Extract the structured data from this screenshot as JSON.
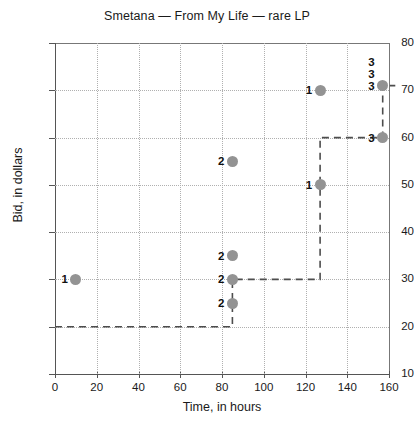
{
  "chart_data": {
    "type": "scatter",
    "title": "Smetana — From My Life — rare LP",
    "xlabel": "Time, in hours",
    "ylabel": "Bid, in dollars",
    "xlim": [
      0,
      160
    ],
    "ylim": [
      10,
      80
    ],
    "xticks": [
      0,
      20,
      40,
      60,
      80,
      100,
      120,
      140,
      160
    ],
    "yticks": [
      10,
      20,
      30,
      40,
      50,
      60,
      70,
      80
    ],
    "grid": true,
    "legend": "none",
    "marker_color": "#939393",
    "step_line_color": "#4d4d4d",
    "points": [
      {
        "x": 10,
        "y": 30,
        "label": "1"
      },
      {
        "x": 85,
        "y": 55,
        "label": "2"
      },
      {
        "x": 85,
        "y": 35,
        "label": "2"
      },
      {
        "x": 85,
        "y": 30,
        "label": "2"
      },
      {
        "x": 85,
        "y": 25,
        "label": "2"
      },
      {
        "x": 127,
        "y": 70,
        "label": "1"
      },
      {
        "x": 127,
        "y": 50,
        "label": "1"
      },
      {
        "x": 157,
        "y": 71,
        "label": "3"
      },
      {
        "x": 157,
        "y": 60,
        "label": "3"
      }
    ],
    "stacked_labels": [
      {
        "x": 157,
        "y": 71,
        "labels": [
          "3",
          "3",
          "3"
        ]
      }
    ],
    "step_line": [
      {
        "x": 0,
        "y": 20
      },
      {
        "x": 85,
        "y": 20
      },
      {
        "x": 85,
        "y": 30
      },
      {
        "x": 127,
        "y": 30
      },
      {
        "x": 127,
        "y": 60
      },
      {
        "x": 157,
        "y": 60
      },
      {
        "x": 157,
        "y": 71
      },
      {
        "x": 163,
        "y": 71
      }
    ]
  }
}
